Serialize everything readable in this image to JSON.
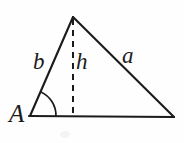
{
  "figure": {
    "kind": "geometry-diagram",
    "background_color": "#fefefe",
    "stroke_color": "#1b1b1b",
    "labels": {
      "vertex_A": "A",
      "side_b": "b",
      "side_a": "a",
      "altitude_h": "h"
    },
    "geometry": {
      "vertex_A": [
        30,
        116
      ],
      "vertex_apex": [
        73,
        17
      ],
      "vertex_right": [
        174,
        117
      ],
      "foot_of_altitude": [
        73,
        116
      ],
      "angle_arc_radius": 26,
      "altitude_dash_pattern": "6 5"
    }
  }
}
